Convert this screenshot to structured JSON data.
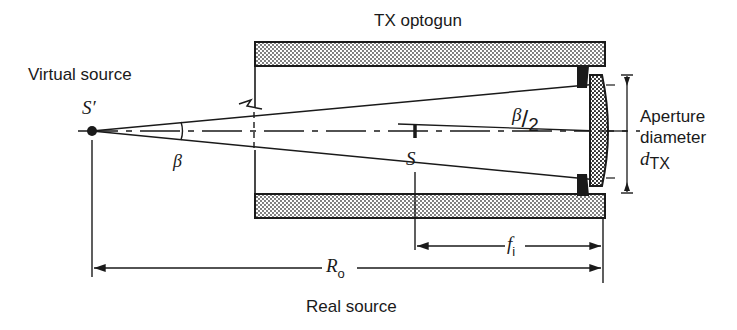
{
  "diagram": {
    "title": "TX optogun",
    "labels": {
      "virtual_source": "Virtual source",
      "virtual_point": "S′",
      "real_point": "S",
      "beta": "β",
      "half_beta_num": "β",
      "half_beta_slash": "/",
      "half_beta_den": "2",
      "aperture_line1": "Aperture",
      "aperture_line2": "diameter",
      "aperture_symbol": "d",
      "aperture_subscript": "TX",
      "focal_symbol": "f",
      "focal_subscript": "i",
      "range_symbol": "R",
      "range_subscript": "o",
      "real_source": "Real source"
    },
    "colors": {
      "ink": "#1a1a1a",
      "background": "#ffffff"
    }
  }
}
